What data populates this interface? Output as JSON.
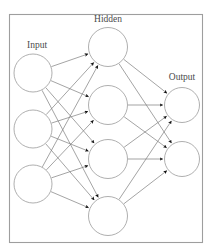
{
  "figure": {
    "background_color": "#ffffff",
    "frame": {
      "x": 9,
      "y": 14,
      "width": 194,
      "height": 229,
      "stroke_color": "#9e9e9e"
    },
    "styles": {
      "node_fill": "#ffffff",
      "node_stroke": "#9a9a9a",
      "edge_color": "#7d7d7d",
      "arrowhead_color": "#111111",
      "label_color": "#4a4a4a"
    }
  },
  "chart_data": {
    "type": "diagram",
    "diagram_kind": "neural-network",
    "architecture": [
      3,
      4,
      2
    ],
    "title": "",
    "layers": [
      {
        "id": "input",
        "label": "Input",
        "label_x": 37,
        "label_y": 48,
        "node_radius": 19,
        "nodes": [
          {
            "id": "i1",
            "cx": 33,
            "cy": 73
          },
          {
            "id": "i2",
            "cx": 33,
            "cy": 129
          },
          {
            "id": "i3",
            "cx": 33,
            "cy": 184
          }
        ]
      },
      {
        "id": "hidden",
        "label": "Hidden",
        "label_x": 108,
        "label_y": 22,
        "node_radius": 19.5,
        "nodes": [
          {
            "id": "h1",
            "cx": 108,
            "cy": 47
          },
          {
            "id": "h2",
            "cx": 108,
            "cy": 105
          },
          {
            "id": "h3",
            "cx": 108,
            "cy": 159
          },
          {
            "id": "h4",
            "cx": 108,
            "cy": 216
          }
        ]
      },
      {
        "id": "output",
        "label": "Output",
        "label_x": 182,
        "label_y": 80,
        "node_radius": 17.5,
        "nodes": [
          {
            "id": "o1",
            "cx": 182,
            "cy": 105
          },
          {
            "id": "o2",
            "cx": 182,
            "cy": 159
          }
        ]
      }
    ],
    "edges": [
      {
        "from": "i1",
        "to": "h1"
      },
      {
        "from": "i1",
        "to": "h2"
      },
      {
        "from": "i1",
        "to": "h3"
      },
      {
        "from": "i1",
        "to": "h4"
      },
      {
        "from": "i2",
        "to": "h1"
      },
      {
        "from": "i2",
        "to": "h2"
      },
      {
        "from": "i2",
        "to": "h3"
      },
      {
        "from": "i2",
        "to": "h4"
      },
      {
        "from": "i3",
        "to": "h1"
      },
      {
        "from": "i3",
        "to": "h2"
      },
      {
        "from": "i3",
        "to": "h3"
      },
      {
        "from": "i3",
        "to": "h4"
      },
      {
        "from": "h1",
        "to": "o1"
      },
      {
        "from": "h1",
        "to": "o2"
      },
      {
        "from": "h2",
        "to": "o1"
      },
      {
        "from": "h2",
        "to": "o2"
      },
      {
        "from": "h3",
        "to": "o1"
      },
      {
        "from": "h3",
        "to": "o2"
      },
      {
        "from": "h4",
        "to": "o1"
      },
      {
        "from": "h4",
        "to": "o2"
      }
    ],
    "edge_direction": "left-to-right",
    "arrowheads": true,
    "legend": null,
    "axis": null,
    "grid": false
  }
}
